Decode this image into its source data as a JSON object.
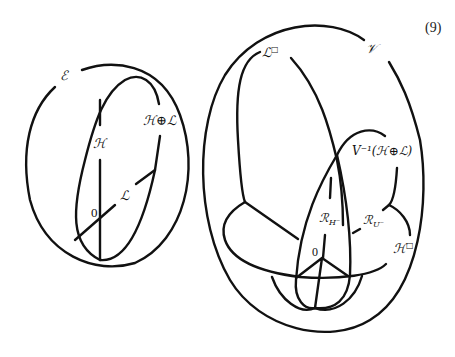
{
  "equation_number": "(9)",
  "left_diagram": {
    "outer_label": "ℰ",
    "inner_label": "ℋ⊕ℒ",
    "vertical_line_label": "ℋ",
    "diagonal_line_label": "ℒ",
    "origin_label": "0"
  },
  "right_diagram": {
    "outer_label": "𝒱",
    "upper_left_label": "ℒ",
    "upper_left_sup": "□",
    "preimage_label": "V⁻¹(ℋ⊕ℒ)",
    "rh_label": "ℛ",
    "rh_sub": "H⁻",
    "ru_label": "ℛ",
    "ru_sub": "U⁻",
    "h_box_label": "ℋ",
    "h_box_sup": "□",
    "origin_label": "0"
  },
  "colors": {
    "stroke": "#111111",
    "background": "#ffffff"
  }
}
